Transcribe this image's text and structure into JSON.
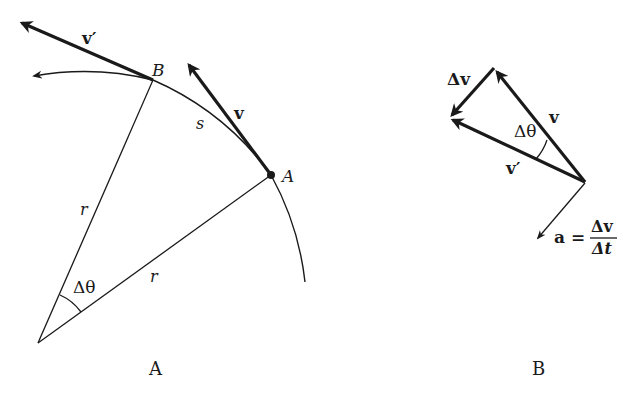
{
  "panel_a": {
    "caption": "A",
    "labels": {
      "v_prime": "v′",
      "v": "v",
      "point_b": "B",
      "point_a": "A",
      "arc_length": "s",
      "radius_1": "r",
      "radius_2": "r",
      "angle": "Δθ"
    }
  },
  "panel_b": {
    "caption": "B",
    "labels": {
      "delta_v": "Δv",
      "v": "v",
      "v_prime": "v′",
      "angle": "Δθ",
      "accel_lhs": "a =",
      "accel_num": "Δv",
      "accel_den": "Δt"
    }
  },
  "colors": {
    "ink": "#1a1a1a",
    "background": "#ffffff"
  }
}
